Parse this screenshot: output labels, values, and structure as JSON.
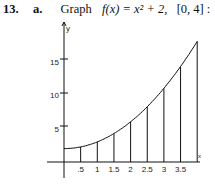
{
  "problem": {
    "number": "13.",
    "part": "a.",
    "verb": "Graph",
    "function_text": "f(x) = x² + 2,",
    "interval": "[0, 4] :"
  },
  "chart_data": {
    "type": "line",
    "function": "x^2 + 2",
    "xlabel": "x",
    "ylabel": "y",
    "xlim": [
      0,
      4
    ],
    "ylim": [
      0,
      18
    ],
    "x_ticks": [
      ".5",
      "1",
      "1.5",
      "2",
      "2.5",
      "3",
      "3.5"
    ],
    "y_ticks": [
      "5",
      "10",
      "15"
    ],
    "vertical_lines_at": [
      0.5,
      1,
      1.5,
      2,
      2.5,
      3,
      3.5,
      4
    ],
    "x": [
      0,
      0.5,
      1,
      1.5,
      2,
      2.5,
      3,
      3.5,
      4
    ],
    "values": [
      2,
      2.25,
      3,
      4.25,
      6,
      8.25,
      11,
      14.25,
      18
    ],
    "grid": false
  }
}
